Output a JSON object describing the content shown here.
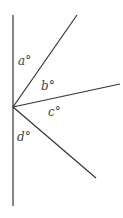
{
  "diagram": {
    "labels": {
      "a": "a°",
      "b": "b°",
      "c": "c°",
      "d": "d°"
    },
    "colors": {
      "line": "#333333",
      "label": "#444444"
    }
  }
}
